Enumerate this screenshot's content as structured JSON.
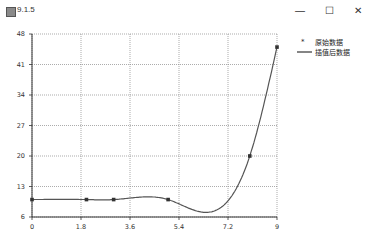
{
  "window": {
    "title": "9.1.5",
    "minimize_icon": "—",
    "maximize_icon": "☐",
    "close_icon": "✕"
  },
  "legend": {
    "items": [
      {
        "label": "原始数据",
        "marker": "*"
      },
      {
        "label": "插值后数据",
        "marker": "line"
      }
    ]
  },
  "chart_data": {
    "type": "line",
    "title": "",
    "xlabel": "",
    "ylabel": "",
    "xlim": [
      0,
      9
    ],
    "ylim": [
      6,
      48
    ],
    "xticks": [
      "0",
      "1.8",
      "3.6",
      "5.4",
      "7.2",
      "9"
    ],
    "yticks": [
      "6",
      "13",
      "20",
      "27",
      "34",
      "41",
      "48"
    ],
    "grid": true,
    "legend_position": "right-top",
    "series": [
      {
        "name": "原始数据",
        "style": "markers",
        "x": [
          0,
          2,
          3,
          5,
          8,
          9
        ],
        "y": [
          10,
          10,
          10,
          10,
          20,
          45
        ]
      },
      {
        "name": "插值后数据",
        "style": "line",
        "x": [
          0,
          1,
          2,
          3,
          4,
          5,
          6,
          6.5,
          7,
          7.5,
          8,
          8.5,
          9
        ],
        "y": [
          10,
          10,
          10,
          10,
          11,
          10,
          8,
          7.7,
          9,
          13,
          20,
          31,
          45
        ]
      }
    ]
  }
}
